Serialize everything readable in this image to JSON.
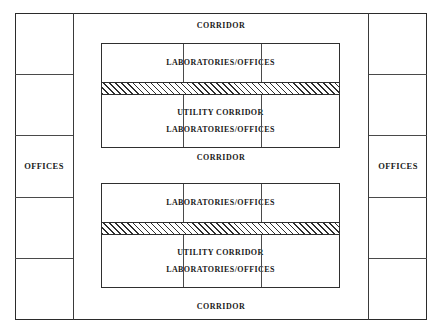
{
  "diagram": {
    "type": "architectural-floor-plan",
    "line_color": "#2f2f2f",
    "background_color": "#ffffff",
    "hatch_color": "#2f2f2f"
  },
  "office_wings": {
    "left": {
      "label": "OFFICES",
      "cell_count": 5,
      "labeled_cell_index": 2,
      "cells": [
        {
          "label": ""
        },
        {
          "label": ""
        },
        {
          "label": "OFFICES"
        },
        {
          "label": ""
        },
        {
          "label": ""
        }
      ]
    },
    "right": {
      "label": "OFFICES",
      "cell_count": 5,
      "labeled_cell_index": 2,
      "cells": [
        {
          "label": ""
        },
        {
          "label": ""
        },
        {
          "label": "OFFICES"
        },
        {
          "label": ""
        },
        {
          "label": ""
        }
      ]
    }
  },
  "corridors": {
    "top": "CORRIDOR",
    "middle": "CORRIDOR",
    "bottom": "CORRIDOR"
  },
  "lab_blocks": [
    {
      "position": "upper",
      "partition_count": 2,
      "rows": {
        "top_label": "LABORATORIES/OFFICES",
        "utility_band_label": "UTILITY CORRIDOR",
        "bottom_label": "LABORATORIES/OFFICES"
      }
    },
    {
      "position": "lower",
      "partition_count": 2,
      "rows": {
        "top_label": "LABORATORIES/OFFICES",
        "utility_band_label": "UTILITY CORRIDOR",
        "bottom_label": "LABORATORIES/OFFICES"
      }
    }
  ]
}
